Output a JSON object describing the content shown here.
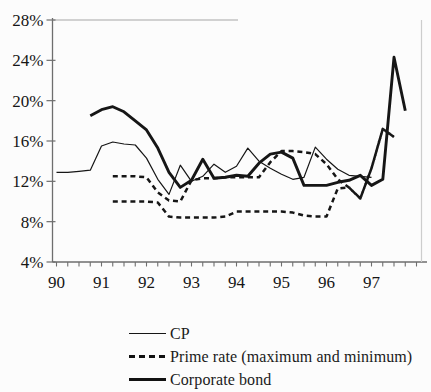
{
  "figure": {
    "title": "",
    "background": "#fcfcfc",
    "ink_color": "#161616",
    "axis_color": "#6e6e6e"
  },
  "chart_data": {
    "type": "line",
    "title": "",
    "xlabel": "",
    "ylabel": "",
    "x_unit": "year",
    "y_unit": "percent",
    "xlim": [
      90,
      98.3
    ],
    "ylim": [
      4,
      28
    ],
    "grid": false,
    "legend_position": "bottom-left",
    "y_ticks": {
      "values": [
        4,
        8,
        12,
        16,
        20,
        24,
        28
      ],
      "labels": [
        "4%",
        "8%",
        "12%",
        "16%",
        "20%",
        "24%",
        "28%"
      ]
    },
    "x_ticks": {
      "values": [
        90,
        91,
        92,
        93,
        94,
        95,
        96,
        97
      ],
      "labels": [
        "90",
        "91",
        "92",
        "93",
        "94",
        "95",
        "96",
        "97"
      ],
      "minor_step": 0.25
    },
    "series": [
      {
        "name": "CP",
        "style": "thin",
        "x": [
          90,
          90.25,
          90.5,
          90.75,
          91,
          91.25,
          91.5,
          91.75,
          92,
          92.25,
          92.5,
          92.75,
          93,
          93.25,
          93.5,
          93.75,
          94,
          94.25,
          94.5,
          94.75,
          95,
          95.25,
          95.5,
          95.75,
          96,
          96.25,
          96.5,
          96.75,
          97
        ],
        "y": [
          12.9,
          12.9,
          13.0,
          13.1,
          15.5,
          15.9,
          15.7,
          15.6,
          14.3,
          12.2,
          10.7,
          13.6,
          12.0,
          12.5,
          13.7,
          12.9,
          13.5,
          15.3,
          14.0,
          13.3,
          12.7,
          12.2,
          12.4,
          15.4,
          14.2,
          13.2,
          12.6,
          12.5,
          12.4
        ]
      },
      {
        "name": "Prime rate (maximum)",
        "style": "dashed",
        "x": [
          91.25,
          91.5,
          91.75,
          92,
          92.25,
          92.5,
          92.75,
          93,
          93.25,
          93.5,
          93.75,
          94,
          94.25,
          94.5,
          94.75,
          95,
          95.25,
          95.5,
          95.75,
          96,
          96.25,
          96.5,
          96.75,
          97,
          97.25,
          97.5
        ],
        "y": [
          12.5,
          12.5,
          12.5,
          12.4,
          10.9,
          10.1,
          10.0,
          12.1,
          12.3,
          12.3,
          12.4,
          12.4,
          12.4,
          12.4,
          13.9,
          15.0,
          15.0,
          14.9,
          14.7,
          13.7,
          12.2,
          11.4,
          10.3,
          13.3,
          17.2,
          16.4
        ]
      },
      {
        "name": "Prime rate (minimum)",
        "style": "dashed",
        "x": [
          91.25,
          91.5,
          91.75,
          92,
          92.25,
          92.5,
          92.75,
          93,
          93.25,
          93.5,
          93.75,
          94,
          94.25,
          94.5,
          94.75,
          95,
          95.25,
          95.5,
          95.75,
          96,
          96.25,
          96.5,
          96.75,
          97,
          97.25,
          97.5
        ],
        "y": [
          10.0,
          10.0,
          10.0,
          10.0,
          9.9,
          8.5,
          8.4,
          8.4,
          8.4,
          8.4,
          8.5,
          9.0,
          9.0,
          9.0,
          9.0,
          9.0,
          8.9,
          8.6,
          8.5,
          8.5,
          11.3,
          11.4,
          10.3,
          13.3,
          17.2,
          16.4
        ]
      },
      {
        "name": "Corporate bond",
        "style": "thick",
        "x": [
          90.75,
          91,
          91.25,
          91.5,
          91.75,
          92,
          92.25,
          92.5,
          92.75,
          93,
          93.25,
          93.5,
          93.75,
          94,
          94.25,
          94.5,
          94.75,
          95,
          95.25,
          95.5,
          95.75,
          96,
          96.25,
          96.5,
          96.75,
          97,
          97.25,
          97.5,
          97.75
        ],
        "y": [
          18.5,
          19.1,
          19.4,
          18.9,
          18.0,
          17.1,
          15.3,
          12.9,
          11.4,
          12.1,
          14.2,
          12.3,
          12.4,
          12.6,
          12.5,
          13.8,
          14.7,
          14.9,
          14.3,
          11.6,
          11.6,
          11.6,
          11.9,
          12.1,
          12.6,
          11.6,
          12.2,
          24.3,
          19.0
        ]
      }
    ]
  },
  "legend": {
    "items": [
      {
        "label": "CP",
        "style": "thin"
      },
      {
        "label": "Prime rate (maximum and minimum)",
        "style": "dashed"
      },
      {
        "label": "Corporate bond",
        "style": "thick"
      }
    ]
  }
}
